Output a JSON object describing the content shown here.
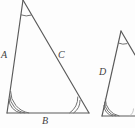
{
  "figure": {
    "background_color": "#fdfdfd",
    "stroke_color": "#5a5a5a",
    "label_color": "#3f3f3f",
    "labels": {
      "side_a": "A",
      "side_b": "B",
      "side_c": "C",
      "side_d": "D"
    },
    "triangles": [
      {
        "name": "large-triangle",
        "vertices": {
          "apex": [
            23,
            0
          ],
          "bottom_left": [
            7,
            113
          ],
          "bottom_right": [
            89,
            113
          ]
        },
        "sides": [
          {
            "label": "A",
            "from": "apex",
            "to": "bottom_left"
          },
          {
            "label": "B",
            "from": "bottom_left",
            "to": "bottom_right"
          },
          {
            "label": "C",
            "from": "apex",
            "to": "bottom_right"
          }
        ],
        "angle_marks": {
          "apex": 1,
          "bottom_left": 3,
          "bottom_right": 2
        }
      },
      {
        "name": "small-triangle",
        "vertices": {
          "apex": [
            121,
            31
          ],
          "bottom_left": [
            102,
            116
          ],
          "bottom_right": [
            135,
            116
          ]
        },
        "sides": [
          {
            "label": "D",
            "from": "apex",
            "to": "bottom_left"
          }
        ],
        "angle_marks": {
          "apex": 1,
          "bottom_left": 3,
          "bottom_right": 2
        },
        "note": "clipped at right edge of image"
      }
    ]
  }
}
